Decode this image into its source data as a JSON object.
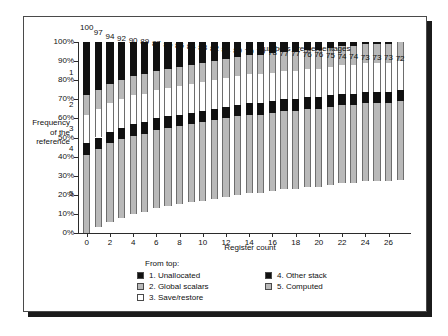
{
  "chart_data": {
    "type": "bar",
    "subtype": "stacked-bar",
    "title": "",
    "annotation": "Numbers are percentages",
    "xlabel": "Register count",
    "ylabel": "Frequency of the reference",
    "ylabel_lines": [
      "Frequency",
      "of the",
      "reference"
    ],
    "ylim": [
      0,
      100
    ],
    "ytick_labels": [
      "0%",
      "10%",
      "20%",
      "30%",
      "40%",
      "50%",
      "60%",
      "70%",
      "80%",
      "90%",
      "100%"
    ],
    "ytick_values": [
      0,
      10,
      20,
      30,
      40,
      50,
      60,
      70,
      80,
      90,
      100
    ],
    "grid": false,
    "legend_position": "bottom",
    "legend_title": "From top:",
    "x": [
      0,
      1,
      2,
      3,
      4,
      5,
      6,
      7,
      8,
      9,
      10,
      11,
      12,
      13,
      14,
      15,
      16,
      17,
      18,
      19,
      20,
      21,
      22,
      23,
      24,
      25,
      26,
      27
    ],
    "xtick_labels": [
      "0",
      "2",
      "4",
      "6",
      "8",
      "10",
      "12",
      "14",
      "16",
      "18",
      "20",
      "22",
      "24",
      "26"
    ],
    "xtick_values": [
      0,
      2,
      4,
      6,
      8,
      10,
      12,
      14,
      16,
      18,
      20,
      22,
      24,
      26
    ],
    "bar_labels": [
      100,
      97,
      94,
      92,
      90,
      89,
      87,
      86,
      85,
      84,
      83,
      82,
      81,
      80,
      79,
      79,
      78,
      77,
      77,
      76,
      76,
      75,
      74,
      74,
      73,
      73,
      73,
      72
    ],
    "series": [
      {
        "name": "1. Unallocated",
        "region_number": "1",
        "color": "#111111",
        "swatch": "sw-black",
        "values": [
          28,
          25,
          22,
          20,
          18,
          17,
          15,
          14,
          13,
          12,
          11,
          10,
          9,
          8,
          7,
          7,
          6,
          5,
          5,
          4,
          4,
          3,
          2,
          2,
          1,
          1,
          1,
          0
        ]
      },
      {
        "name": "2. Global scalars",
        "region_number": "2",
        "color": "#b9b9b9",
        "swatch": "sw-gray",
        "values": [
          10,
          10,
          10,
          10,
          10,
          10,
          10,
          10,
          10,
          10,
          10,
          10,
          10,
          10,
          10,
          10,
          10,
          10,
          10,
          10,
          10,
          10,
          10,
          10,
          10,
          10,
          10,
          10
        ]
      },
      {
        "name": "3. Save/restore",
        "region_number": "3",
        "color": "#ffffff",
        "swatch": "sw-white",
        "values": [
          15,
          15,
          15,
          15,
          15,
          15,
          15,
          15,
          15,
          15,
          15,
          15,
          15,
          15,
          15,
          15,
          15,
          15,
          15,
          15,
          15,
          15,
          15,
          15,
          15,
          15,
          15,
          15
        ]
      },
      {
        "name": "4. Other stack",
        "region_number": "4",
        "color": "#111111",
        "swatch": "sw-black",
        "values": [
          6,
          6,
          6,
          6,
          6,
          6,
          6,
          6,
          6,
          6,
          6,
          6,
          6,
          6,
          6,
          6,
          6,
          6,
          6,
          6,
          6,
          6,
          6,
          6,
          6,
          6,
          6,
          6
        ]
      },
      {
        "name": "5. Computed",
        "region_number": "5",
        "color": "#b9b9b9",
        "swatch": "sw-gray",
        "values": [
          41,
          41,
          41,
          41,
          41,
          41,
          41,
          41,
          41,
          41,
          41,
          41,
          41,
          41,
          41,
          41,
          41,
          41,
          41,
          41,
          41,
          41,
          41,
          41,
          41,
          41,
          41,
          41
        ]
      }
    ]
  },
  "legend": {
    "title": "From top:",
    "column_1": [
      "1. Unallocated",
      "2. Global scalars",
      "3. Save/restore"
    ],
    "column_2": [
      "4. Other stack",
      "5. Computed"
    ]
  }
}
